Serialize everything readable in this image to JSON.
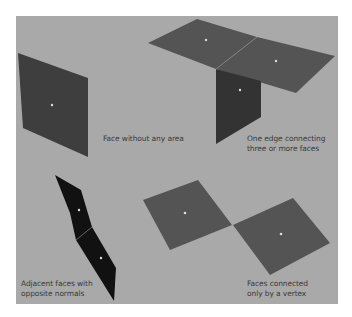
{
  "figure": {
    "background_color": "#a9a9a9",
    "face_color_dark": "#3e3e3e",
    "face_color_medium": "#545454",
    "face_color_black": "#111111",
    "center_dot_color": "#dddddd",
    "labels": [
      {
        "id": "zero-area",
        "text": "Face without any area"
      },
      {
        "id": "non-manifold-edge",
        "text": "One edge connecting\nthree or more faces"
      },
      {
        "id": "opposite-normals",
        "text": "Adjacent faces with\nopposite normals"
      },
      {
        "id": "vertex-only",
        "text": "Faces connected\nonly by a vertex"
      }
    ]
  }
}
